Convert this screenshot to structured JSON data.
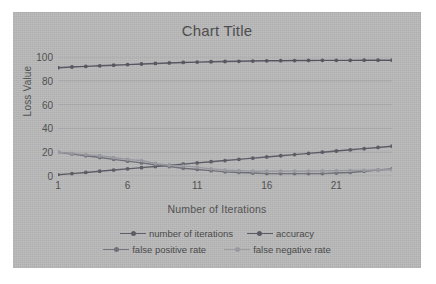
{
  "chart_data": {
    "type": "line",
    "title": "Chart Title",
    "xlabel": "Number of Iterations",
    "ylabel": "Loss Value",
    "xlim": [
      1,
      25
    ],
    "ylim": [
      0,
      100
    ],
    "ytick_labels": [
      "0",
      "20",
      "40",
      "60",
      "80",
      "100"
    ],
    "ytick_values": [
      0,
      20,
      40,
      60,
      80,
      100
    ],
    "xtick_labels": [
      "1",
      "6",
      "11",
      "16",
      "21"
    ],
    "xtick_values": [
      1,
      6,
      11,
      16,
      21
    ],
    "grid": "horizontal",
    "legend_position": "bottom",
    "x": [
      1,
      2,
      3,
      4,
      5,
      6,
      7,
      8,
      9,
      10,
      11,
      12,
      13,
      14,
      15,
      16,
      17,
      18,
      19,
      20,
      21,
      22,
      23,
      24,
      25
    ],
    "series": [
      {
        "name": "number of iterations",
        "color": "#5a5a64",
        "marker": "circle",
        "values": [
          1,
          2,
          3,
          4,
          5,
          6,
          7,
          8,
          9,
          10,
          11,
          12,
          13,
          14,
          15,
          16,
          17,
          18,
          19,
          20,
          21,
          22,
          23,
          24,
          25
        ]
      },
      {
        "name": "accuracy",
        "color": "#55555f",
        "marker": "circle",
        "values": [
          91,
          91.6,
          92.1,
          92.6,
          93.1,
          93.6,
          94.1,
          94.6,
          95,
          95.4,
          95.7,
          96,
          96.2,
          96.4,
          96.6,
          96.8,
          96.9,
          97,
          97.1,
          97.2,
          97.2,
          97.2,
          97.3,
          97.3,
          97.3
        ]
      },
      {
        "name": "false positive rate",
        "color": "#6e6e78",
        "marker": "circle",
        "values": [
          20,
          18.5,
          17,
          15.5,
          14,
          12.5,
          11,
          9.5,
          8,
          6.5,
          5.5,
          4.5,
          3.5,
          3,
          2.5,
          2,
          2,
          2,
          2,
          2,
          2.5,
          3,
          4,
          5,
          6
        ]
      },
      {
        "name": "false negative rate",
        "color": "#9a9aa2",
        "marker": "circle",
        "values": [
          20,
          19,
          18,
          17,
          15.5,
          14,
          13,
          10.5,
          9,
          8.5,
          7.5,
          6,
          5,
          4.5,
          4,
          4,
          4,
          4,
          4,
          4.2,
          4.4,
          4.6,
          4.8,
          5,
          5.2
        ]
      }
    ]
  },
  "legend": {
    "items": [
      {
        "label": "number of iterations"
      },
      {
        "label": "accuracy"
      },
      {
        "label": "false positive rate"
      },
      {
        "label": "false negative rate"
      }
    ]
  },
  "colors": {
    "card_background": "#b9b9b9",
    "page_background": "#ffffff",
    "gridline": "#a6a6a6",
    "text": "#4e4e4e"
  }
}
